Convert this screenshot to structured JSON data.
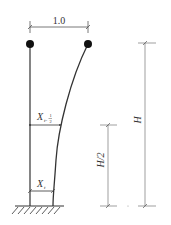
{
  "diagram": {
    "width_label": "1.0",
    "node_labels": {
      "mid_symbol": "X",
      "mid_subscript_prefix": "t-",
      "mid_subscript_num": "1",
      "mid_subscript_den": "2",
      "base_symbol": "X",
      "base_subscript": "t"
    },
    "dimensions": {
      "half_height_label": "H/2",
      "full_height_label": "H"
    },
    "colors": {
      "line": "#333333",
      "dim_line": "#777777",
      "dot": "#111111"
    }
  }
}
